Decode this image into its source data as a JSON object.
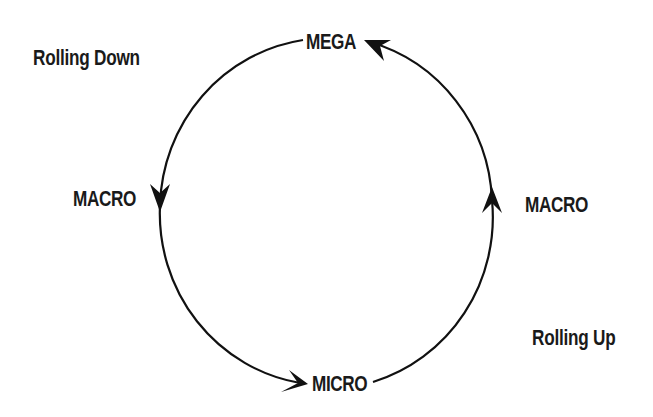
{
  "diagram": {
    "type": "cycle",
    "colors": {
      "stroke": "#111111",
      "text": "#1a1a1a",
      "background": "#ffffff"
    },
    "nodes": {
      "top": {
        "label": "MEGA"
      },
      "left": {
        "label": "MACRO"
      },
      "right": {
        "label": "MACRO"
      },
      "bottom": {
        "label": "MICRO"
      }
    },
    "captions": {
      "rolling_down": "Rolling Down",
      "rolling_up": "Rolling Up"
    },
    "edges": [
      {
        "from": "MEGA",
        "to": "MACRO (left)",
        "direction": "counterclockwise",
        "group": "Rolling Down"
      },
      {
        "from": "MACRO (left)",
        "to": "MICRO",
        "direction": "counterclockwise",
        "group": "Rolling Down"
      },
      {
        "from": "MICRO",
        "to": "MACRO (right)",
        "direction": "counterclockwise",
        "group": "Rolling Up"
      },
      {
        "from": "MACRO (right)",
        "to": "MEGA",
        "direction": "counterclockwise",
        "group": "Rolling Up"
      }
    ]
  }
}
